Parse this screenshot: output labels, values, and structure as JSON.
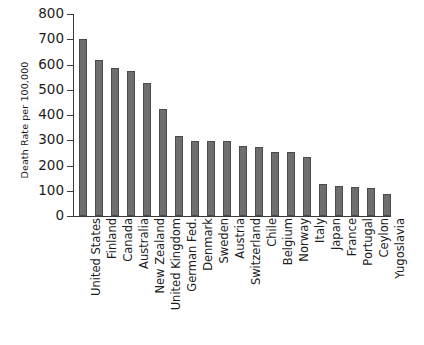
{
  "chart_data": {
    "type": "bar",
    "title": "",
    "xlabel": "",
    "ylabel": "Death Rate per 100,000",
    "ylim": [
      0,
      800
    ],
    "yticks": [
      0,
      100,
      200,
      300,
      400,
      500,
      600,
      700,
      800
    ],
    "ytick_labels": [
      "0",
      "100",
      "200",
      "300",
      "400",
      "500",
      "600",
      "700",
      "800"
    ],
    "grid": false,
    "legend": false,
    "bar_color": "#6e6e6e",
    "bar_edge_color": "#4a4a4a",
    "background_color": "#ffffff",
    "categories": [
      "United States",
      "Finland",
      "Canada",
      "Australia",
      "New Zealand",
      "United Kingdom",
      "German Fed.",
      "Denmark",
      "Sweden",
      "Austria",
      "Switzerland",
      "Chile",
      "Belgium",
      "Norway",
      "Italy",
      "Japan",
      "France",
      "Portugal",
      "Ceylon",
      "Yugoslavia"
    ],
    "values": [
      700,
      616,
      585,
      573,
      525,
      425,
      315,
      299,
      298,
      297,
      278,
      272,
      255,
      253,
      233,
      125,
      117,
      114,
      112,
      88
    ]
  }
}
